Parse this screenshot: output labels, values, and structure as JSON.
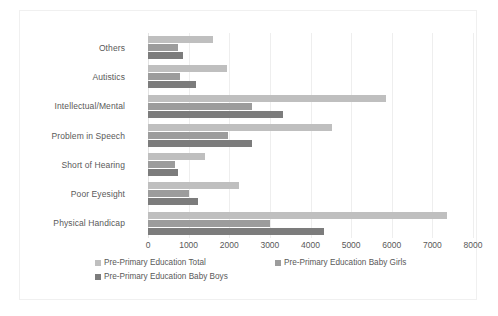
{
  "chart_data": {
    "type": "bar",
    "orientation": "horizontal",
    "title": "",
    "xlabel": "",
    "ylabel": "",
    "xlim": [
      0,
      8000
    ],
    "xticks": [
      0,
      1000,
      2000,
      3000,
      4000,
      5000,
      6000,
      7000,
      8000
    ],
    "xtick_labels": [
      "0",
      "1000",
      "2000",
      "3000",
      "4000",
      "5000",
      "6000",
      "7000",
      "8000"
    ],
    "grid": "vertical",
    "legend_position": "bottom",
    "categories": [
      "Physical Handicap",
      "Poor Eyesight",
      "Short of Hearing",
      "Problem in Speech",
      "Intellectual/Mental",
      "Autistics",
      "Others"
    ],
    "series": [
      {
        "name": "Pre-Primary Education Total",
        "color": "#bfbfbf",
        "values": [
          7350,
          2230,
          1400,
          4540,
          5870,
          1950,
          1600
        ]
      },
      {
        "name": "Pre-Primary Education Baby Girls",
        "color": "#9c9c9c",
        "values": [
          3000,
          1010,
          670,
          1980,
          2550,
          780,
          730
        ]
      },
      {
        "name": "Pre-Primary Education Baby Boys",
        "color": "#7c7c7c",
        "values": [
          4340,
          1220,
          730,
          2560,
          3330,
          1170,
          850
        ]
      }
    ]
  }
}
